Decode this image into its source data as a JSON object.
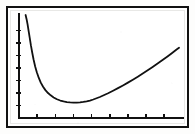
{
  "figure": {
    "title": "",
    "caption": "",
    "style": "monochrome-calculator-plot",
    "line_color": "#111111",
    "axis_color": "#111111",
    "frame_color": "#111111",
    "background_color": "#ffffff"
  },
  "chart_data": {
    "type": "line",
    "title": "",
    "subtitle": "",
    "xlabel": "",
    "ylabel": "",
    "xlim": [
      0,
      100
    ],
    "ylim": [
      0,
      100
    ],
    "grid": false,
    "legend": null,
    "axis_ticks": {
      "x_tick_count": 8,
      "x_tick_values": [
        11,
        22,
        33,
        44,
        55,
        66,
        77,
        88
      ],
      "x_tick_labels": [],
      "y_tick_count": 7,
      "y_tick_values": [
        12,
        24,
        36,
        48,
        60,
        72,
        84
      ],
      "y_tick_labels": []
    },
    "series": [
      {
        "name": "curve",
        "shape": "convex-minimum",
        "x": [
          4.0,
          4.6,
          5.2,
          5.8,
          6.5,
          7.2,
          8.0,
          8.8,
          9.8,
          10.8,
          12.0,
          13.2,
          14.6,
          16.0,
          17.6,
          19.2,
          21.0,
          23.0,
          25.0,
          27.0,
          29.0,
          31.0,
          33.0,
          35.0,
          37.0,
          39.0,
          41.0,
          43.0,
          45.0,
          47.0,
          49.0,
          51.0,
          54.0,
          57.0,
          60.0,
          63.0,
          66.0,
          69.0,
          72.0,
          75.0,
          78.0,
          81.0,
          84.0,
          87.0,
          90.0,
          93.0,
          95.5,
          97.0
        ],
        "y": [
          99.0,
          95.0,
          90.0,
          84.0,
          77.0,
          70.0,
          63.0,
          56.5,
          49.5,
          44.0,
          38.5,
          34.0,
          30.0,
          26.8,
          24.0,
          21.8,
          19.8,
          18.0,
          16.8,
          15.9,
          15.3,
          15.0,
          14.8,
          14.8,
          15.0,
          15.4,
          16.0,
          16.8,
          17.8,
          19.0,
          20.2,
          21.6,
          23.8,
          26.2,
          28.7,
          31.3,
          34.0,
          36.8,
          39.7,
          42.7,
          45.8,
          49.0,
          52.3,
          55.7,
          59.2,
          62.8,
          65.8,
          67.5
        ]
      }
    ]
  }
}
